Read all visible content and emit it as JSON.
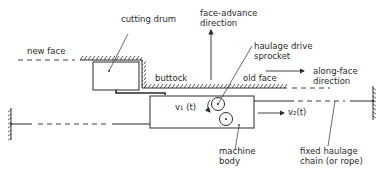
{
  "diagram": {
    "labels": {
      "cutting_drum": "cutting drum",
      "face_advance_line1": "face-advance",
      "face_advance_line2": "direction",
      "new_face": "new face",
      "haulage_line1": "haulage drive",
      "haulage_line2": "sprocket",
      "buttock": "buttock",
      "old_face": "old face",
      "along_face_line1": "along-face",
      "along_face_line2": "direction",
      "v1": "v₁ (t)",
      "v2": "v₂(t)",
      "machine_line1": "machine",
      "machine_line2": "body",
      "chain_line1": "fixed haulage",
      "chain_line2": "chain (or rope)"
    },
    "colors": {
      "ink": "#2a2a2a",
      "background": "#ffffff"
    }
  }
}
